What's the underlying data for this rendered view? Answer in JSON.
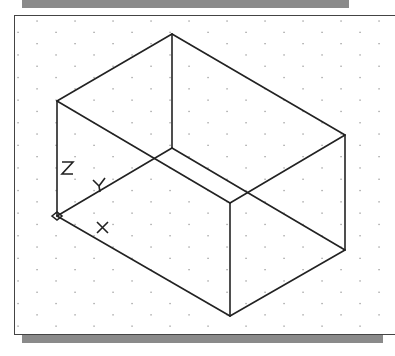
{
  "viewport": {
    "title": "Isometric box drawing viewport",
    "grid": {
      "visible": true,
      "dx": 38,
      "dy": 11.3,
      "color": "#9a9a9a"
    },
    "line_color": "#222222",
    "shadow_color": "#8a8a8a"
  },
  "box": {
    "vertices": {
      "top": [
        172,
        34
      ],
      "left_top": [
        57,
        101
      ],
      "right_top": [
        345,
        135
      ],
      "front_top": [
        230,
        203
      ],
      "inner": [
        172,
        148
      ],
      "origin": [
        57,
        216
      ],
      "right_bottom": [
        345,
        250
      ],
      "front_bottom": [
        230,
        316
      ]
    }
  },
  "ucs_icon": {
    "labels": {
      "x": "X",
      "y": "Y",
      "z": "Z"
    },
    "origin": [
      57,
      216
    ]
  }
}
